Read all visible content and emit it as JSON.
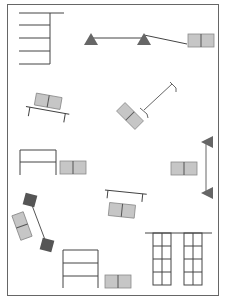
{
  "diagram": {
    "type": "floor-plan-layout",
    "caption_fragment": "",
    "colors": {
      "border": "#666666",
      "line": "#444444",
      "box_fill": "#c6c6c6",
      "box_stroke": "#8a8a8a",
      "box_divider": "#555555",
      "triangle_fill": "#666666",
      "dark_square": "#555555"
    },
    "elements": [
      {
        "id": "stair-ladder-top-left",
        "kind": "ladder-rungs"
      },
      {
        "id": "beam-with-triangles",
        "kind": "beam-supports"
      },
      {
        "id": "box-top-right",
        "kind": "double-box"
      },
      {
        "id": "tilted-bench-left",
        "kind": "bench-with-box"
      },
      {
        "id": "diagonal-rod-with-box",
        "kind": "rod-box"
      },
      {
        "id": "frame-with-box-left",
        "kind": "frame-box"
      },
      {
        "id": "vertical-beam-right",
        "kind": "beam-supports-vertical"
      },
      {
        "id": "box-right-middle",
        "kind": "double-box"
      },
      {
        "id": "bench-center",
        "kind": "bench-with-box"
      },
      {
        "id": "dumbbell-diagonal",
        "kind": "dumbbell-box"
      },
      {
        "id": "frame-with-box-bottom",
        "kind": "frame-box"
      },
      {
        "id": "grid-racks-bottom-right",
        "kind": "grid-racks"
      }
    ]
  }
}
